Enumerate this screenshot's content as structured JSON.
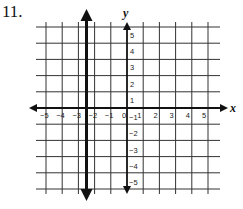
{
  "problem": {
    "number": "11."
  },
  "chart_data": {
    "type": "line",
    "title": "",
    "xlabel": "x",
    "ylabel": "y",
    "xlim": [
      -5,
      5
    ],
    "ylim": [
      -5,
      5
    ],
    "grid": true,
    "x_ticks": [
      "-5",
      "-4",
      "-3",
      "-2",
      "-1",
      "0",
      "1",
      "2",
      "3",
      "4",
      "5"
    ],
    "y_ticks": [
      "-5",
      "-4",
      "-3",
      "-2",
      "-1",
      "1",
      "2",
      "3",
      "4",
      "5"
    ],
    "series": [
      {
        "name": "vertical line x = -2.5",
        "type": "vertical_line",
        "x": -2.5,
        "points": [
          [
            -2.5,
            -6
          ],
          [
            -2.5,
            6
          ]
        ],
        "arrows": "both",
        "style": "thick"
      }
    ]
  },
  "labels": {
    "x_axis": "x",
    "y_axis": "y",
    "x_ticks": [
      "−5",
      "−4",
      "−3",
      "−2",
      "−1",
      "0",
      "1",
      "2",
      "3",
      "4",
      "5"
    ],
    "y_ticks_pos": [
      "1",
      "2",
      "3",
      "4",
      "5"
    ],
    "y_ticks_neg": [
      "−1",
      "−2",
      "−3",
      "−4",
      "−5"
    ]
  },
  "colors": {
    "grid": "#333333",
    "axis": "#111111",
    "line": "#111111"
  }
}
